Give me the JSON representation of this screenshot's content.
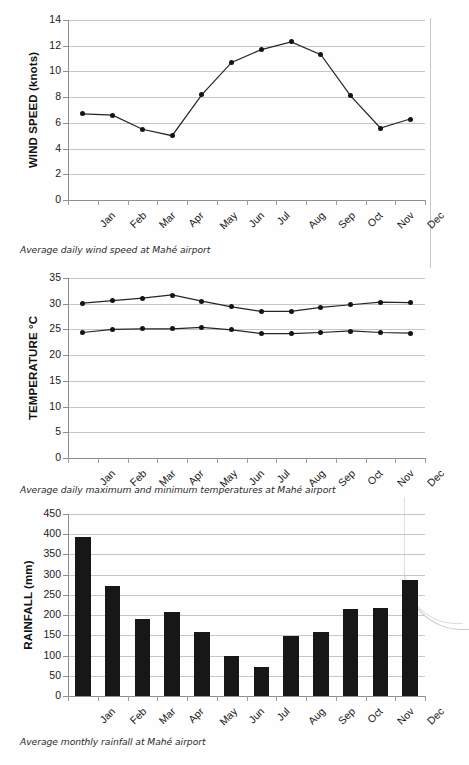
{
  "page": {
    "months": [
      "Jan",
      "Feb",
      "Mar",
      "Apr",
      "May",
      "Jun",
      "Jul",
      "Aug",
      "Sep",
      "Oct",
      "Nov",
      "Dec"
    ]
  },
  "charts": [
    {
      "id": "wind",
      "caption": "Average daily wind speed at Mahé airport",
      "ylabel": "WIND SPEED (knots)",
      "yticks": [
        "0",
        "2",
        "4",
        "6",
        "8",
        "10",
        "12",
        "14"
      ]
    },
    {
      "id": "temp",
      "caption": "Average daily maximum and minimum temperatures at Mahé airport",
      "ylabel": "TEMPERATURE °C",
      "yticks": [
        "0",
        "5",
        "10",
        "15",
        "20",
        "25",
        "30",
        "35"
      ]
    },
    {
      "id": "rain",
      "caption": "Average monthly rainfall at Mahé airport",
      "ylabel": "RAINFALL (mm)",
      "yticks": [
        "0",
        "50",
        "100",
        "150",
        "200",
        "250",
        "300",
        "350",
        "400",
        "450"
      ]
    }
  ],
  "chart_data": [
    {
      "type": "line",
      "title": "Average daily wind speed at Mahé airport",
      "xlabel": "",
      "ylabel": "WIND SPEED (knots)",
      "categories": [
        "Jan",
        "Feb",
        "Mar",
        "Apr",
        "May",
        "Jun",
        "Jul",
        "Aug",
        "Sep",
        "Oct",
        "Nov",
        "Dec"
      ],
      "values": [
        6.7,
        6.6,
        5.5,
        5.0,
        8.2,
        10.7,
        11.7,
        12.3,
        11.3,
        8.1,
        5.6,
        6.3
      ],
      "ylim": [
        0,
        14
      ],
      "ytick_step": 2,
      "grid": true,
      "legend": "none",
      "marker": "filled-circle"
    },
    {
      "type": "line",
      "title": "Average daily maximum and minimum temperatures at Mahé airport",
      "xlabel": "",
      "ylabel": "TEMPERATURE °C",
      "categories": [
        "Jan",
        "Feb",
        "Mar",
        "Apr",
        "May",
        "Jun",
        "Jul",
        "Aug",
        "Sep",
        "Oct",
        "Nov",
        "Dec"
      ],
      "series": [
        {
          "name": "Maximum",
          "values": [
            30.1,
            30.6,
            31.1,
            31.7,
            30.5,
            29.4,
            28.5,
            28.5,
            29.3,
            29.8,
            30.3,
            30.2
          ]
        },
        {
          "name": "Minimum",
          "values": [
            24.4,
            25.0,
            25.1,
            25.1,
            25.4,
            24.9,
            24.2,
            24.2,
            24.4,
            24.7,
            24.4,
            24.3
          ]
        }
      ],
      "ylim": [
        0,
        35
      ],
      "ytick_step": 5,
      "grid": true,
      "legend": "none",
      "marker": "filled-circle"
    },
    {
      "type": "bar",
      "title": "Average monthly rainfall at Mahé airport",
      "xlabel": "",
      "ylabel": "RAINFALL (mm)",
      "categories": [
        "Jan",
        "Feb",
        "Mar",
        "Apr",
        "May",
        "Jun",
        "Jul",
        "Aug",
        "Sep",
        "Oct",
        "Nov",
        "Dec"
      ],
      "values": [
        393,
        271,
        190,
        208,
        158,
        99,
        73,
        148,
        158,
        216,
        218,
        288
      ],
      "ylim": [
        0,
        450
      ],
      "ytick_step": 50,
      "grid": true,
      "legend": "none",
      "bar_color": "#171717"
    }
  ]
}
